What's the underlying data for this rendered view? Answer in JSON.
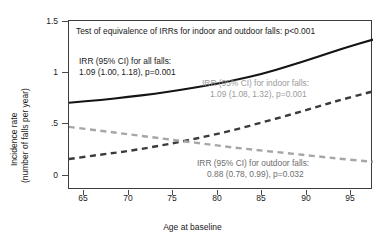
{
  "chart_data": {
    "type": "line",
    "title": "",
    "xlabel": "Age at baseline",
    "ylabel_line1": "Incidence rate",
    "ylabel_line2": "(number of falls per year)",
    "xlim": [
      63.4,
      97.4
    ],
    "ylim": [
      0,
      1.5
    ],
    "xticks": [
      65,
      70,
      75,
      80,
      85,
      90,
      95
    ],
    "xtick_labels": [
      "65",
      "70",
      "75",
      "80",
      "85",
      "90",
      "95"
    ],
    "yticks": [
      0,
      0.5,
      1,
      1.5
    ],
    "ytick_labels": [
      "0",
      ".5",
      "1",
      "1.5"
    ],
    "grid": false,
    "legend": "none (inline annotations)",
    "series": [
      {
        "name": "All falls",
        "style": "solid",
        "color": "#141414",
        "x": [
          63.4,
          67,
          70,
          73,
          76,
          79,
          82,
          85,
          88,
          91,
          94,
          97.4
        ],
        "values": [
          0.775,
          0.8,
          0.825,
          0.855,
          0.89,
          0.93,
          0.975,
          1.03,
          1.1,
          1.175,
          1.255,
          1.335
        ]
      },
      {
        "name": "Indoor falls",
        "style": "dashed",
        "color": "#3a3a3a",
        "x": [
          63.4,
          67,
          70,
          73,
          76,
          79,
          82,
          85,
          88,
          91,
          94,
          97.4
        ],
        "values": [
          0.275,
          0.315,
          0.345,
          0.385,
          0.43,
          0.48,
          0.535,
          0.6,
          0.665,
          0.735,
          0.805,
          0.875
        ]
      },
      {
        "name": "Outdoor falls",
        "style": "dashed",
        "color": "#a6a6a6",
        "x": [
          63.4,
          67,
          70,
          73,
          76,
          79,
          82,
          85,
          88,
          91,
          94,
          97.4
        ],
        "values": [
          0.56,
          0.525,
          0.495,
          0.465,
          0.435,
          0.405,
          0.375,
          0.35,
          0.325,
          0.3,
          0.275,
          0.25
        ]
      }
    ],
    "annotations": [
      {
        "id": "equivalence-test",
        "color": "#1a1a1a",
        "line1": "Test of equivalence of IRRs for indoor and outdoor falls: p<0.001",
        "line2": ""
      },
      {
        "id": "all-falls",
        "color": "#1a1a1a",
        "line1": "IRR (95% CI) for all falls:",
        "line2": "1.09 (1.00, 1.18), p=0.001"
      },
      {
        "id": "indoor-falls",
        "color": "#9b9b9b",
        "line1": "IRR (95% CI) for indoor falls:",
        "line2": "1.09 (1.08, 1.32), p=0.001"
      },
      {
        "id": "outdoor-falls",
        "color": "#6e6e6e",
        "line1": "IRR (95% CI) for outdoor falls:",
        "line2": "0.88 (0.78, 0.99), p=0.032"
      }
    ]
  }
}
